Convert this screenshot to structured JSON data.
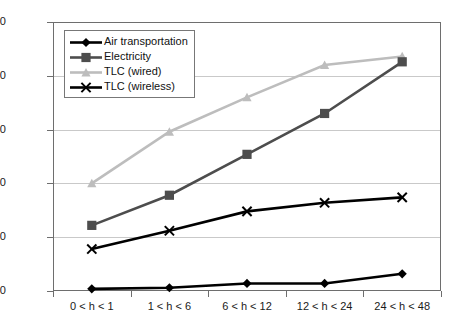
{
  "chart_data": {
    "type": "line",
    "title": "",
    "xlabel": "",
    "ylabel": "",
    "categories": [
      "0 < h < 1",
      "1 < h < 6",
      "6 < h < 12",
      "12 < h < 24",
      "24 < h < 48"
    ],
    "ylim": [
      0,
      2.5
    ],
    "yticks": [
      0,
      0.5,
      1.0,
      1.5,
      2.0,
      2.5
    ],
    "ytick_labels": [
      "0,00",
      "0,50",
      "1,00",
      "1,50",
      "2,00",
      "2,50"
    ],
    "grid": true,
    "legend_position": "upper-left inside",
    "decimal_separator": ",",
    "series": [
      {
        "name": "Air transportation",
        "values": [
          0.02,
          0.03,
          0.07,
          0.07,
          0.16
        ],
        "color": "#000000",
        "marker": "diamond"
      },
      {
        "name": "Electricity",
        "values": [
          0.61,
          0.89,
          1.27,
          1.65,
          2.13
        ],
        "color": "#4d4d4d",
        "marker": "square"
      },
      {
        "name": "TLC (wired)",
        "values": [
          1.0,
          1.48,
          1.8,
          2.1,
          2.18
        ],
        "color": "#bdbdbd",
        "marker": "triangle"
      },
      {
        "name": "TLC (wireless)",
        "values": [
          0.39,
          0.56,
          0.74,
          0.82,
          0.87
        ],
        "color": "#000000",
        "marker": "x"
      }
    ]
  },
  "axis": {
    "frame_color": "#6e6e6e",
    "grid_color": "#c9c9c9"
  }
}
